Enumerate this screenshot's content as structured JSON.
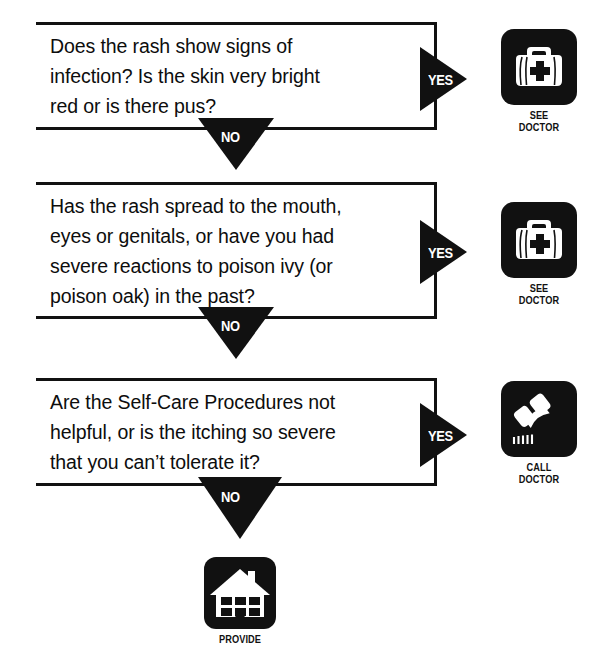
{
  "diagram": {
    "background_color": "#ffffff",
    "ink_color": "#111111"
  },
  "steps": [
    {
      "id": "step-1",
      "question": "Does the rash show signs of\ninfection? Is the skin very bright\nred or is there pus?",
      "yes_label": "YES",
      "no_label": "NO",
      "yes_outcome": {
        "icon": "medical-bag-icon",
        "label": "SEE\nDOCTOR"
      }
    },
    {
      "id": "step-2",
      "question": "Has the rash spread to the mouth,\neyes or genitals, or have you had\nsevere reactions to poison ivy (or\npoison oak) in the past?",
      "yes_label": "YES",
      "no_label": "NO",
      "yes_outcome": {
        "icon": "medical-bag-icon",
        "label": "SEE\nDOCTOR"
      }
    },
    {
      "id": "step-3",
      "question": "Are the Self-Care Procedures not\nhelpful, or is the itching so severe\nthat you can’t tolerate it?",
      "yes_label": "YES",
      "no_label": "NO",
      "yes_outcome": {
        "icon": "telephone-icon",
        "label": "CALL\nDOCTOR"
      }
    }
  ],
  "final_outcome": {
    "id": "final-outcome",
    "icon": "house-icon",
    "label": "PROVIDE"
  }
}
